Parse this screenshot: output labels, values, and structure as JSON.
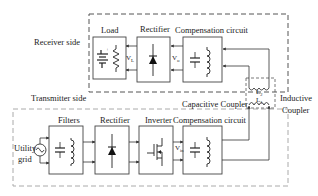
{
  "diagram": {
    "receiver": {
      "side_label": "Receiver side",
      "blocks": [
        {
          "id": "load",
          "label": "Load",
          "voltage": "V",
          "voltage_sub": "L"
        },
        {
          "id": "rectifier",
          "label": "Rectifier",
          "voltage": "V",
          "voltage_sub": "o"
        },
        {
          "id": "compensation",
          "label": "Compensation circuit"
        }
      ]
    },
    "transmitter": {
      "side_label": "Transmitter side",
      "source_label_line1": "Utility",
      "source_label_line2": "grid",
      "blocks": [
        {
          "id": "filters",
          "label": "Filters"
        },
        {
          "id": "rectifier",
          "label": "Rectifier"
        },
        {
          "id": "inverter",
          "label": "Inverter"
        },
        {
          "id": "compensation",
          "label": "Compensation circuit",
          "voltage": "V",
          "voltage_sub": "in"
        }
      ]
    },
    "coupler": {
      "capacitive_label": "Capacitive Coupler",
      "inductive_label_line1": "Inductive",
      "inductive_label_line2": "Coupler",
      "coil2": {
        "symbol": "L",
        "sub": "2"
      },
      "coil1": {
        "symbol": "L",
        "sub": "1"
      }
    },
    "colors": {
      "line": "#333333",
      "dash": "#555555",
      "dash_light": "#aaaaaa"
    }
  }
}
